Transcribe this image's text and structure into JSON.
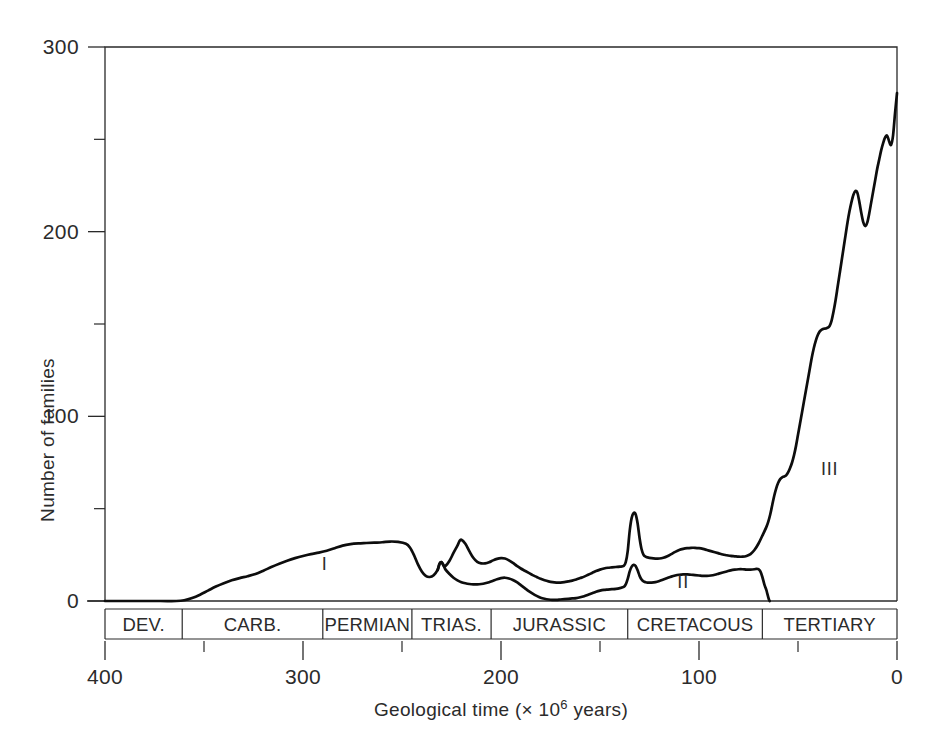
{
  "chart_data": {
    "type": "line",
    "title": "",
    "xlabel": "Geological time (× 10⁶ years)",
    "ylabel": "Number of families",
    "xlim": [
      400,
      0
    ],
    "ylim": [
      0,
      300
    ],
    "x_reversed": true,
    "grid": false,
    "legend": "none",
    "x_ticks": [
      400,
      300,
      200,
      100,
      0
    ],
    "x_tick_labels": [
      "400",
      "300",
      "200",
      "100",
      "0"
    ],
    "x_minor_ticks": [
      350,
      250,
      150,
      50
    ],
    "y_ticks": [
      0,
      100,
      200,
      300
    ],
    "y_tick_labels": [
      "0",
      "100",
      "200",
      "300"
    ],
    "y_minor_ticks": [
      50,
      150,
      250
    ],
    "annotations": [
      {
        "text": "I",
        "x": 289,
        "y": 17
      },
      {
        "text": "II",
        "x": 108,
        "y": 7
      },
      {
        "text": "III",
        "x": 34,
        "y": 68
      }
    ],
    "period_bands": [
      {
        "label": "DEV.",
        "start": 400,
        "end": 361
      },
      {
        "label": "CARB.",
        "start": 361,
        "end": 290
      },
      {
        "label": "PERMIAN",
        "start": 290,
        "end": 245
      },
      {
        "label": "TRIAS.",
        "start": 245,
        "end": 205
      },
      {
        "label": "JURASSIC",
        "start": 205,
        "end": 136
      },
      {
        "label": "CRETACOUS",
        "start": 136,
        "end": 68
      },
      {
        "label": "TERTIARY",
        "start": 68,
        "end": 0
      }
    ],
    "series": [
      {
        "name": "I",
        "points": [
          [
            400,
            0
          ],
          [
            385,
            0
          ],
          [
            372,
            0
          ],
          [
            364,
            0
          ],
          [
            360,
            0.4
          ],
          [
            356,
            1.6
          ],
          [
            352,
            3.4
          ],
          [
            348,
            5.6
          ],
          [
            344,
            7.8
          ],
          [
            340,
            9.6
          ],
          [
            336,
            11.2
          ],
          [
            332,
            12.4
          ],
          [
            328,
            13.4
          ],
          [
            324,
            14.6
          ],
          [
            320,
            16.4
          ],
          [
            316,
            18.4
          ],
          [
            312,
            20.2
          ],
          [
            308,
            21.8
          ],
          [
            304,
            23.2
          ],
          [
            300,
            24.4
          ],
          [
            296,
            25.4
          ],
          [
            292,
            26.2
          ],
          [
            288,
            27.2
          ],
          [
            284,
            28.6
          ],
          [
            280,
            30.0
          ],
          [
            276,
            30.8
          ],
          [
            272,
            31.2
          ],
          [
            268,
            31.4
          ],
          [
            264,
            31.6
          ],
          [
            260,
            31.8
          ],
          [
            256,
            32.2
          ],
          [
            252,
            32.0
          ],
          [
            248,
            31.0
          ],
          [
            246,
            29.0
          ],
          [
            244,
            25.0
          ],
          [
            242,
            20.0
          ],
          [
            240,
            16.0
          ],
          [
            238,
            13.6
          ],
          [
            236,
            13.0
          ],
          [
            234,
            14.0
          ],
          [
            232,
            16.8
          ],
          [
            231,
            20.2
          ],
          [
            230,
            21.0
          ],
          [
            229,
            19.2
          ],
          [
            228,
            19.0
          ],
          [
            226,
            21.8
          ],
          [
            224,
            26.0
          ],
          [
            222,
            30.0
          ],
          [
            221,
            32.4
          ],
          [
            220,
            33.2
          ],
          [
            218,
            31.0
          ],
          [
            216,
            27.0
          ],
          [
            214,
            23.4
          ],
          [
            212,
            21.2
          ],
          [
            210,
            20.4
          ],
          [
            208,
            20.4
          ],
          [
            206,
            21.0
          ],
          [
            204,
            22.0
          ],
          [
            202,
            22.8
          ],
          [
            200,
            23.2
          ],
          [
            198,
            23.0
          ],
          [
            196,
            22.0
          ],
          [
            194,
            20.6
          ],
          [
            192,
            19.0
          ],
          [
            190,
            17.6
          ],
          [
            188,
            16.4
          ],
          [
            186,
            15.2
          ],
          [
            184,
            14.0
          ],
          [
            182,
            13.0
          ],
          [
            180,
            12.0
          ],
          [
            178,
            11.2
          ],
          [
            176,
            10.6
          ],
          [
            174,
            10.2
          ],
          [
            172,
            10.0
          ],
          [
            170,
            10.0
          ],
          [
            168,
            10.2
          ],
          [
            166,
            10.6
          ],
          [
            164,
            11.0
          ],
          [
            162,
            11.6
          ],
          [
            160,
            12.4
          ],
          [
            158,
            13.2
          ],
          [
            156,
            14.2
          ],
          [
            154,
            15.2
          ],
          [
            152,
            16.2
          ],
          [
            150,
            17.0
          ],
          [
            148,
            17.6
          ],
          [
            146,
            18.0
          ],
          [
            144,
            18.2
          ],
          [
            142,
            18.4
          ],
          [
            140,
            18.6
          ],
          [
            138,
            19.0
          ],
          [
            137,
            21.0
          ],
          [
            136,
            27.0
          ],
          [
            135,
            38.0
          ],
          [
            134,
            45.0
          ],
          [
            133,
            47.6
          ],
          [
            132,
            47.0
          ],
          [
            131,
            42.0
          ],
          [
            130,
            34.0
          ],
          [
            129,
            28.0
          ],
          [
            128,
            25.0
          ],
          [
            127,
            24.0
          ],
          [
            126,
            23.6
          ],
          [
            124,
            23.2
          ],
          [
            122,
            23.0
          ],
          [
            120,
            23.0
          ],
          [
            118,
            23.4
          ],
          [
            116,
            24.2
          ],
          [
            114,
            25.4
          ],
          [
            112,
            26.6
          ],
          [
            110,
            27.6
          ],
          [
            108,
            28.2
          ],
          [
            106,
            28.6
          ],
          [
            104,
            28.8
          ],
          [
            102,
            28.8
          ],
          [
            100,
            28.6
          ],
          [
            98,
            28.2
          ],
          [
            96,
            27.6
          ],
          [
            94,
            27.0
          ],
          [
            92,
            26.4
          ],
          [
            90,
            25.8
          ],
          [
            88,
            25.2
          ],
          [
            86,
            24.8
          ],
          [
            84,
            24.4
          ],
          [
            82,
            24.2
          ],
          [
            80,
            24.0
          ],
          [
            78,
            24.0
          ],
          [
            76,
            24.4
          ],
          [
            74,
            25.4
          ],
          [
            72,
            27.6
          ],
          [
            70,
            31.0
          ],
          [
            68,
            35.4
          ],
          [
            66,
            40.0
          ],
          [
            65,
            43.0
          ],
          [
            64,
            47.0
          ],
          [
            63,
            52.0
          ],
          [
            62,
            57.0
          ],
          [
            61,
            61.0
          ],
          [
            60,
            64.0
          ],
          [
            59,
            66.0
          ],
          [
            58,
            67.0
          ],
          [
            57,
            67.4
          ],
          [
            56,
            68.0
          ],
          [
            55,
            69.6
          ],
          [
            54,
            72.0
          ],
          [
            53,
            75.0
          ],
          [
            52,
            79.0
          ],
          [
            51,
            84.0
          ],
          [
            50,
            90.0
          ],
          [
            49,
            96.0
          ],
          [
            48,
            102.0
          ],
          [
            47,
            108.0
          ],
          [
            46,
            114.0
          ],
          [
            45,
            120.0
          ],
          [
            44,
            126.0
          ],
          [
            43,
            132.0
          ],
          [
            42,
            137.0
          ],
          [
            41,
            141.0
          ],
          [
            40,
            144.0
          ],
          [
            39,
            146.0
          ],
          [
            38,
            147.0
          ],
          [
            37,
            147.4
          ],
          [
            36,
            147.6
          ],
          [
            35,
            148.0
          ],
          [
            34,
            149.0
          ],
          [
            33,
            152.0
          ],
          [
            32,
            157.0
          ],
          [
            31,
            163.0
          ],
          [
            30,
            170.0
          ],
          [
            29,
            177.0
          ],
          [
            28,
            184.0
          ],
          [
            27,
            191.0
          ],
          [
            26,
            198.0
          ],
          [
            25,
            205.0
          ],
          [
            24,
            211.0
          ],
          [
            23,
            216.0
          ],
          [
            22,
            220.0
          ],
          [
            21,
            222.0
          ],
          [
            20,
            221.0
          ],
          [
            19,
            216.0
          ],
          [
            18,
            210.0
          ],
          [
            17,
            205.0
          ],
          [
            16,
            203.0
          ],
          [
            15,
            205.0
          ],
          [
            14,
            210.0
          ],
          [
            13,
            216.0
          ],
          [
            12,
            222.0
          ],
          [
            11,
            228.0
          ],
          [
            10,
            234.0
          ],
          [
            9,
            239.0
          ],
          [
            8,
            244.0
          ],
          [
            7,
            248.0
          ],
          [
            6,
            251.0
          ],
          [
            5,
            252.0
          ],
          [
            4,
            249.0
          ],
          [
            3,
            247.0
          ],
          [
            2,
            252.0
          ],
          [
            1,
            264.0
          ],
          [
            0,
            275.0
          ]
        ]
      },
      {
        "name": "II",
        "points": [
          [
            232,
            16.8
          ],
          [
            231,
            20.2
          ],
          [
            230,
            21.0
          ],
          [
            229,
            19.2
          ],
          [
            228,
            17.0
          ],
          [
            226,
            14.6
          ],
          [
            224,
            12.6
          ],
          [
            222,
            11.2
          ],
          [
            220,
            10.2
          ],
          [
            218,
            9.6
          ],
          [
            216,
            9.2
          ],
          [
            214,
            9.0
          ],
          [
            212,
            9.0
          ],
          [
            210,
            9.2
          ],
          [
            208,
            9.6
          ],
          [
            206,
            10.2
          ],
          [
            204,
            11.0
          ],
          [
            202,
            11.8
          ],
          [
            200,
            12.4
          ],
          [
            198,
            12.6
          ],
          [
            196,
            12.2
          ],
          [
            194,
            11.4
          ],
          [
            192,
            10.2
          ],
          [
            190,
            8.6
          ],
          [
            188,
            7.0
          ],
          [
            186,
            5.4
          ],
          [
            184,
            4.0
          ],
          [
            182,
            2.8
          ],
          [
            180,
            1.8
          ],
          [
            178,
            1.2
          ],
          [
            176,
            0.8
          ],
          [
            174,
            0.6
          ],
          [
            172,
            0.6
          ],
          [
            170,
            0.8
          ],
          [
            168,
            1.0
          ],
          [
            166,
            1.2
          ],
          [
            164,
            1.4
          ],
          [
            162,
            1.6
          ],
          [
            160,
            2.0
          ],
          [
            158,
            2.6
          ],
          [
            156,
            3.4
          ],
          [
            154,
            4.2
          ],
          [
            152,
            5.0
          ],
          [
            150,
            5.6
          ],
          [
            148,
            6.0
          ],
          [
            146,
            6.2
          ],
          [
            144,
            6.4
          ],
          [
            142,
            6.6
          ],
          [
            140,
            7.0
          ],
          [
            138,
            7.6
          ],
          [
            137,
            9.0
          ],
          [
            136,
            12.0
          ],
          [
            135,
            16.0
          ],
          [
            134,
            18.6
          ],
          [
            133,
            19.6
          ],
          [
            132,
            19.0
          ],
          [
            131,
            16.6
          ],
          [
            130,
            13.6
          ],
          [
            129,
            11.6
          ],
          [
            128,
            10.6
          ],
          [
            127,
            10.2
          ],
          [
            126,
            10.0
          ],
          [
            124,
            10.0
          ],
          [
            122,
            10.2
          ],
          [
            120,
            10.8
          ],
          [
            118,
            11.6
          ],
          [
            116,
            12.4
          ],
          [
            114,
            13.2
          ],
          [
            112,
            13.8
          ],
          [
            110,
            14.2
          ],
          [
            108,
            14.4
          ],
          [
            106,
            14.4
          ],
          [
            104,
            14.2
          ],
          [
            102,
            14.0
          ],
          [
            100,
            13.8
          ],
          [
            98,
            13.6
          ],
          [
            96,
            13.6
          ],
          [
            94,
            13.8
          ],
          [
            92,
            14.2
          ],
          [
            90,
            14.8
          ],
          [
            88,
            15.4
          ],
          [
            86,
            16.0
          ],
          [
            84,
            16.6
          ],
          [
            82,
            17.0
          ],
          [
            80,
            17.2
          ],
          [
            78,
            17.2
          ],
          [
            76,
            17.0
          ],
          [
            74,
            17.0
          ],
          [
            72,
            17.2
          ],
          [
            71,
            17.4
          ],
          [
            70,
            17.2
          ],
          [
            69,
            16.0
          ],
          [
            68,
            13.0
          ],
          [
            67,
            9.0
          ],
          [
            66,
            6.0
          ],
          [
            65.5,
            4.0
          ],
          [
            65,
            2.0
          ],
          [
            64.6,
            0.6
          ],
          [
            64.3,
            0
          ]
        ]
      }
    ]
  },
  "axis": {
    "y_title": "Number of families",
    "x_title_parts": {
      "main": "Geological time (× 10",
      "exponent": "6",
      "tail": " years)"
    }
  },
  "colors": {
    "curve": "#0d0d0d",
    "axis": "#2a2a2a",
    "text": "#2b2b2b",
    "background": "#ffffff"
  }
}
